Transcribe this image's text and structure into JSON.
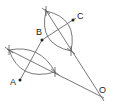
{
  "diagram": {
    "type": "geometric-construction",
    "points": [
      {
        "id": "A",
        "label": "A",
        "x": 20,
        "y": 80,
        "lx": 10,
        "ly": 85
      },
      {
        "id": "B",
        "label": "B",
        "x": 42,
        "y": 40,
        "lx": 36,
        "ly": 35
      },
      {
        "id": "C",
        "label": "C",
        "x": 73,
        "y": 20,
        "lx": 77,
        "ly": 19
      },
      {
        "id": "O",
        "label": "O",
        "x": 101,
        "y": 95,
        "lx": 98,
        "ly": 92
      }
    ],
    "segments": [
      {
        "name": "segment-AB",
        "from": "A",
        "to": "B"
      },
      {
        "name": "segment-BC",
        "from": "B",
        "to": "C"
      }
    ],
    "perpendicular_bisectors": [
      {
        "name": "bisector-AB",
        "p1": [
          9,
          50
        ],
        "p2": [
          55,
          72
        ],
        "to": "O"
      },
      {
        "name": "bisector-BC",
        "p1": [
          46,
          11
        ],
        "p2": [
          71,
          51
        ],
        "to": "O"
      }
    ]
  }
}
